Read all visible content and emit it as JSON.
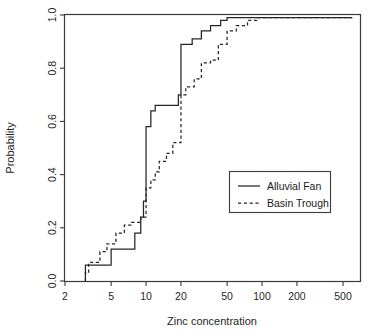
{
  "chart_data": {
    "type": "line",
    "title": "",
    "subtitle": "",
    "xlabel": "Zinc concentration",
    "ylabel": "Probability",
    "xscale": "log",
    "yscale": "linear",
    "xlim": [
      2,
      700
    ],
    "ylim": [
      0.0,
      1.0
    ],
    "grid": false,
    "legend_position": "center-right",
    "xticks": [
      2,
      5,
      10,
      20,
      50,
      100,
      200,
      500
    ],
    "xticklabels": [
      "2",
      "5",
      "10",
      "20",
      "50",
      "100",
      "200",
      "500"
    ],
    "yticks": [
      0.0,
      0.2,
      0.4,
      0.6,
      0.8,
      1.0
    ],
    "yticklabels": [
      "0.0",
      "0.2",
      "0.4",
      "0.6",
      "0.8",
      "1.0"
    ],
    "annotations": [],
    "series": [
      {
        "name": "Alluvial Fan",
        "style": "solid",
        "color": "#262626",
        "description": "Empirical cumulative distribution (step function) of zinc concentration for alluvial fan samples",
        "points": [
          {
            "x": 3.0,
            "y": 0.0
          },
          {
            "x": 3.0,
            "y": 0.06
          },
          {
            "x": 5.0,
            "y": 0.06
          },
          {
            "x": 5.0,
            "y": 0.12
          },
          {
            "x": 8.0,
            "y": 0.12
          },
          {
            "x": 8.0,
            "y": 0.18
          },
          {
            "x": 9.0,
            "y": 0.18
          },
          {
            "x": 9.0,
            "y": 0.24
          },
          {
            "x": 9.5,
            "y": 0.24
          },
          {
            "x": 9.5,
            "y": 0.3
          },
          {
            "x": 10.0,
            "y": 0.3
          },
          {
            "x": 10.0,
            "y": 0.58
          },
          {
            "x": 11.0,
            "y": 0.58
          },
          {
            "x": 11.0,
            "y": 0.64
          },
          {
            "x": 12.0,
            "y": 0.64
          },
          {
            "x": 12.0,
            "y": 0.66
          },
          {
            "x": 19.0,
            "y": 0.66
          },
          {
            "x": 19.0,
            "y": 0.7
          },
          {
            "x": 20.0,
            "y": 0.7
          },
          {
            "x": 20.0,
            "y": 0.89
          },
          {
            "x": 25.0,
            "y": 0.89
          },
          {
            "x": 25.0,
            "y": 0.91
          },
          {
            "x": 30.0,
            "y": 0.91
          },
          {
            "x": 30.0,
            "y": 0.94
          },
          {
            "x": 36.0,
            "y": 0.94
          },
          {
            "x": 36.0,
            "y": 0.96
          },
          {
            "x": 44.0,
            "y": 0.96
          },
          {
            "x": 44.0,
            "y": 0.98
          },
          {
            "x": 50.0,
            "y": 0.98
          },
          {
            "x": 50.0,
            "y": 0.99
          },
          {
            "x": 600.0,
            "y": 0.99
          }
        ]
      },
      {
        "name": "Basin Trough",
        "style": "dashed",
        "color": "#262626",
        "description": "Empirical cumulative distribution (step function) of zinc concentration for basin trough samples",
        "points": [
          {
            "x": 3.0,
            "y": 0.0
          },
          {
            "x": 3.0,
            "y": 0.03
          },
          {
            "x": 3.2,
            "y": 0.03
          },
          {
            "x": 3.2,
            "y": 0.07
          },
          {
            "x": 4.0,
            "y": 0.07
          },
          {
            "x": 4.0,
            "y": 0.11
          },
          {
            "x": 4.6,
            "y": 0.11
          },
          {
            "x": 4.6,
            "y": 0.14
          },
          {
            "x": 5.5,
            "y": 0.14
          },
          {
            "x": 5.5,
            "y": 0.18
          },
          {
            "x": 6.5,
            "y": 0.18
          },
          {
            "x": 6.5,
            "y": 0.21
          },
          {
            "x": 7.5,
            "y": 0.21
          },
          {
            "x": 7.5,
            "y": 0.22
          },
          {
            "x": 9.0,
            "y": 0.22
          },
          {
            "x": 9.0,
            "y": 0.24
          },
          {
            "x": 10.0,
            "y": 0.24
          },
          {
            "x": 10.0,
            "y": 0.35
          },
          {
            "x": 11.0,
            "y": 0.35
          },
          {
            "x": 11.0,
            "y": 0.38
          },
          {
            "x": 12.0,
            "y": 0.38
          },
          {
            "x": 12.0,
            "y": 0.41
          },
          {
            "x": 13.0,
            "y": 0.41
          },
          {
            "x": 13.0,
            "y": 0.45
          },
          {
            "x": 15.0,
            "y": 0.45
          },
          {
            "x": 15.0,
            "y": 0.48
          },
          {
            "x": 17.0,
            "y": 0.48
          },
          {
            "x": 17.0,
            "y": 0.52
          },
          {
            "x": 20.0,
            "y": 0.52
          },
          {
            "x": 20.0,
            "y": 0.7
          },
          {
            "x": 22.0,
            "y": 0.7
          },
          {
            "x": 22.0,
            "y": 0.73
          },
          {
            "x": 26.0,
            "y": 0.73
          },
          {
            "x": 26.0,
            "y": 0.76
          },
          {
            "x": 30.0,
            "y": 0.76
          },
          {
            "x": 30.0,
            "y": 0.82
          },
          {
            "x": 36.0,
            "y": 0.82
          },
          {
            "x": 36.0,
            "y": 0.83
          },
          {
            "x": 42.0,
            "y": 0.83
          },
          {
            "x": 42.0,
            "y": 0.89
          },
          {
            "x": 50.0,
            "y": 0.89
          },
          {
            "x": 50.0,
            "y": 0.94
          },
          {
            "x": 60.0,
            "y": 0.94
          },
          {
            "x": 60.0,
            "y": 0.96
          },
          {
            "x": 75.0,
            "y": 0.96
          },
          {
            "x": 75.0,
            "y": 0.98
          },
          {
            "x": 90.0,
            "y": 0.98
          },
          {
            "x": 90.0,
            "y": 0.99
          },
          {
            "x": 600.0,
            "y": 0.99
          }
        ]
      }
    ],
    "legend": [
      {
        "label": "Alluvial Fan",
        "style": "solid"
      },
      {
        "label": "Basin Trough",
        "style": "dashed"
      }
    ]
  }
}
